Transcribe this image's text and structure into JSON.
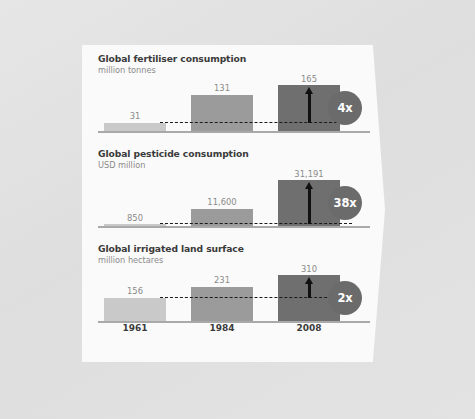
{
  "palette": {
    "page_background": "#e2e2e2",
    "panel_background": "#fafafa",
    "bar_1961": "#c9c9c9",
    "bar_1984": "#9b9b9b",
    "bar_2008": "#6f6f6f",
    "badge": "#6b6b6b",
    "badge_text": "#ffffff",
    "title_text": "#3b3b3b",
    "subtitle_text": "#8a8a8a",
    "value_label_text": "#8a8a8a",
    "baseline": "#a9a9a9",
    "dashed_line": "#1a1a1a",
    "arrow": "#111111"
  },
  "axis": {
    "years": [
      "1961",
      "1984",
      "2008"
    ]
  },
  "chart_data": [
    {
      "type": "bar",
      "title": "Global fertiliser consumption",
      "subtitle": "million tonnes",
      "ylabel": "million tonnes",
      "xlabel": "",
      "categories": [
        "1961",
        "1984",
        "2008"
      ],
      "values": [
        31,
        131,
        165
      ],
      "value_labels": [
        "31",
        "131",
        "165"
      ],
      "multiplier": "4x",
      "multiplier_note": "growth from 1961 to 2008",
      "reference_line_at": 31,
      "arrow_from": 31,
      "arrow_to": 165,
      "ylim": [
        0,
        165
      ],
      "grid": false,
      "legend": "none"
    },
    {
      "type": "bar",
      "title": "Global pesticide consumption",
      "subtitle": "USD million",
      "ylabel": "USD million",
      "xlabel": "",
      "categories": [
        "1961",
        "1984",
        "2008"
      ],
      "values": [
        850,
        11600,
        31191
      ],
      "value_labels": [
        "850",
        "11,600",
        "31,191"
      ],
      "multiplier": "38x",
      "multiplier_note": "growth from 1961 to 2008",
      "reference_line_at": 850,
      "arrow_from": 850,
      "arrow_to": 31191,
      "ylim": [
        0,
        31191
      ],
      "grid": false,
      "legend": "none"
    },
    {
      "type": "bar",
      "title": "Global irrigated land surface",
      "subtitle": "million hectares",
      "ylabel": "million hectares",
      "xlabel": "",
      "categories": [
        "1961",
        "1984",
        "2008"
      ],
      "values": [
        156,
        231,
        310
      ],
      "value_labels": [
        "156",
        "231",
        "310"
      ],
      "multiplier": "2x",
      "multiplier_note": "growth from 1961 to 2008",
      "reference_line_at": 156,
      "arrow_from": 156,
      "arrow_to": 310,
      "ylim": [
        0,
        310
      ],
      "grid": false,
      "legend": "none"
    }
  ]
}
